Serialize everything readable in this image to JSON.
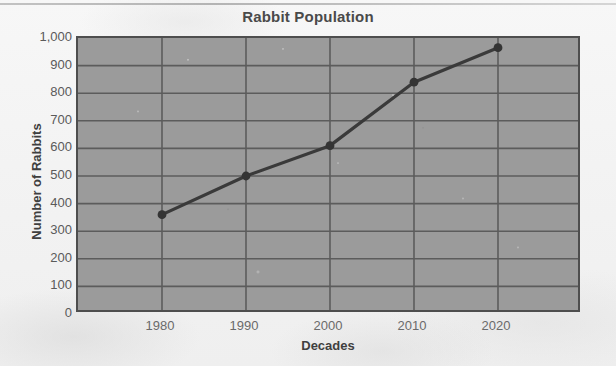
{
  "chart_data": {
    "type": "line",
    "title": "Rabbit Population",
    "xlabel": "Decades",
    "ylabel": "Number of Rabbits",
    "categories": [
      "1980",
      "1990",
      "2000",
      "2010",
      "2020"
    ],
    "x": [
      1980,
      1990,
      2000,
      2010,
      2020
    ],
    "values": [
      360,
      500,
      610,
      840,
      965
    ],
    "series": [
      {
        "name": "Rabbit Population",
        "values": [
          360,
          500,
          610,
          840,
          965
        ]
      }
    ],
    "ylim": [
      0,
      1000
    ],
    "ytick_labels": [
      "0",
      "100",
      "200",
      "300",
      "400",
      "500",
      "600",
      "700",
      "800",
      "900",
      "1,000"
    ],
    "ytick_values": [
      0,
      100,
      200,
      300,
      400,
      500,
      600,
      700,
      800,
      900,
      1000
    ],
    "xtick_labels": [
      "1980",
      "1990",
      "2000",
      "2010",
      "2020"
    ],
    "grid": true,
    "legend": "none",
    "line_color": "#3a3a3a",
    "marker_color": "#343434",
    "plot_background": "#9b9b9b",
    "gridline_color": "#5c5c5c",
    "axis_border_color": "#4e4e4e",
    "page_background": "#f4f4f4"
  }
}
